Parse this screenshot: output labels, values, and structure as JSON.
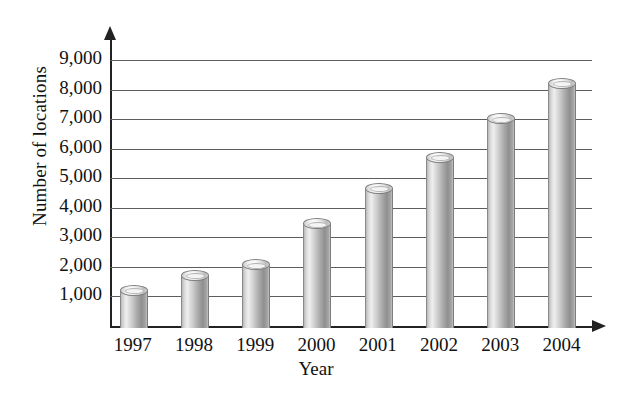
{
  "chart_data": {
    "type": "bar",
    "title": "",
    "xlabel": "Year",
    "ylabel": "Number of locations",
    "categories": [
      "1997",
      "1998",
      "1999",
      "2000",
      "2001",
      "2002",
      "2003",
      "2004"
    ],
    "values": [
      1300,
      1800,
      2150,
      3550,
      4750,
      5800,
      7100,
      8300
    ],
    "ylim": [
      0,
      9000
    ],
    "ytick_labels": [
      "1,000",
      "2,000",
      "3,000",
      "4,000",
      "5,000",
      "6,000",
      "7,000",
      "8,000",
      "9,000"
    ],
    "ytick_values": [
      1000,
      2000,
      3000,
      4000,
      5000,
      6000,
      7000,
      8000,
      9000
    ],
    "grid": true,
    "legend": "none",
    "bar_style": "3d-cylinder",
    "colors": {
      "bar_fill": "#c0c0c0",
      "bar_edge": "#7e7e7e",
      "gridline": "#5d5d5d",
      "axis": "#222222",
      "text": "#111111",
      "background": "#ffffff"
    }
  }
}
